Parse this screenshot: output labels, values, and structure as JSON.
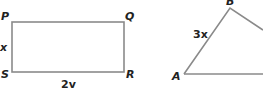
{
  "figures": {
    "rectangle": {
      "vertices": {
        "top_left": "P",
        "top_right": "Q",
        "bottom_right": "R",
        "bottom_left": "S"
      },
      "side_labels": {
        "left": "x",
        "bottom": "2v"
      }
    },
    "triangle": {
      "vertices": {
        "left": "A",
        "top": "B"
      },
      "side_labels": {
        "AB": "3x"
      }
    }
  },
  "colors": {
    "stroke": "#8a8a8a",
    "text": "#222222"
  }
}
